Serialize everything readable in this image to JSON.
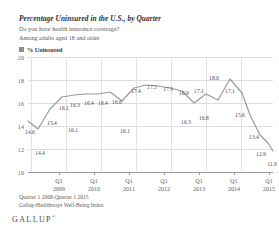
{
  "header": {
    "title": "Percentage Uninsured in the U.S., by Quarter",
    "subtitle_1": "Do you have health insurance coverage?",
    "subtitle_2": "Among adults aged 18 and older"
  },
  "legend": {
    "label": "% Uninsured",
    "swatch_color": "#8c8c8c",
    "icon": "legend-square-icon"
  },
  "footer": {
    "line_1": "Quarter 1 2008-Quarter 1 2015",
    "line_2": "Gallup-Healthways Well-Being Index",
    "brand": "GALLUP",
    "brand_mark": "®"
  },
  "colors": {
    "line": "#9a9a9a",
    "grid": "#dcdcdc",
    "axis": "#9a9a9a",
    "text": "#3a3a3a"
  },
  "chart_data": {
    "type": "line",
    "title": "Percentage Uninsured in the U.S., by Quarter",
    "subtitle": "Do you have health insurance coverage? Among adults aged 18 and older",
    "xlabel": "",
    "ylabel": "",
    "ylim": [
      10,
      20
    ],
    "yticks": [
      10,
      12,
      14,
      16,
      18,
      20
    ],
    "ytick_labels": [
      "10",
      "12",
      "14",
      "16",
      "18",
      "20"
    ],
    "grid": true,
    "legend_position": "top-left",
    "series": [
      {
        "name": "% Uninsured",
        "color": "#9a9a9a",
        "x": [
          "Q1 2008",
          "Q2 2008",
          "Q3 2008",
          "Q4 2008",
          "Q1 2009",
          "Q2 2009",
          "Q3 2009",
          "Q4 2009",
          "Q1 2010",
          "Q2 2010",
          "Q3 2010",
          "Q4 2010",
          "Q1 2011",
          "Q2 2011",
          "Q3 2011",
          "Q4 2011",
          "Q1 2012",
          "Q2 2012",
          "Q3 2012",
          "Q4 2012",
          "Q1 2013",
          "Q2 2013",
          "Q3 2013",
          "Q4 2013",
          "Q1 2014",
          "Q2 2014",
          "Q3 2014",
          "Q4 2014",
          "Q1 2015"
        ],
        "values": [
          14.6,
          14.4,
          15.4,
          16.1,
          16.3,
          16.4,
          16.4,
          16.6,
          16.1,
          16.4,
          16.4,
          16.6,
          16.1,
          17.4,
          17.5,
          17.3,
          16.9,
          16.3,
          17.1,
          16.8,
          18.0,
          17.1,
          15.6,
          13.4,
          12.9,
          11.9,
          11.9,
          11.9,
          11.9
        ]
      }
    ],
    "point_labels": [
      {
        "text": "14.6",
        "x": 2,
        "y": 72,
        "pos": "above"
      },
      {
        "text": "14.4",
        "x": 12,
        "y": 93,
        "pos": "below"
      },
      {
        "text": "15.4",
        "x": 24,
        "y": 63,
        "pos": "above"
      },
      {
        "text": "16.1",
        "x": 45,
        "y": 70,
        "pos": "below"
      },
      {
        "text": "16.1",
        "x": 36,
        "y": 48,
        "pos": "above"
      },
      {
        "text": "16.3",
        "x": 47,
        "y": 45,
        "pos": "above"
      },
      {
        "text": "16.4",
        "x": 61,
        "y": 43,
        "pos": "above"
      },
      {
        "text": "16.4",
        "x": 75,
        "y": 43,
        "pos": "above"
      },
      {
        "text": "16.6",
        "x": 89,
        "y": 42,
        "pos": "above"
      },
      {
        "text": "16.1",
        "x": 97,
        "y": 71,
        "pos": "below"
      },
      {
        "text": "17.4",
        "x": 108,
        "y": 31,
        "pos": "above"
      },
      {
        "text": "17.5",
        "x": 124,
        "y": 27,
        "pos": "above"
      },
      {
        "text": "17.3",
        "x": 140,
        "y": 29,
        "pos": "above"
      },
      {
        "text": "16.9",
        "x": 156,
        "y": 33,
        "pos": "above"
      },
      {
        "text": "16.3",
        "x": 158,
        "y": 62,
        "pos": "below"
      },
      {
        "text": "17.1",
        "x": 171,
        "y": 31,
        "pos": "above"
      },
      {
        "text": "16.8",
        "x": 176,
        "y": 58,
        "pos": "below"
      },
      {
        "text": "18.0",
        "x": 186,
        "y": 18,
        "pos": "above"
      },
      {
        "text": "17.1",
        "x": 202,
        "y": 31,
        "pos": "above"
      },
      {
        "text": "15.6",
        "x": 212,
        "y": 55,
        "pos": "below"
      },
      {
        "text": "13.4",
        "x": 226,
        "y": 77,
        "pos": "below"
      },
      {
        "text": "12.9",
        "x": 233,
        "y": 94,
        "pos": "below"
      },
      {
        "text": "11.9",
        "x": 244,
        "y": 104,
        "pos": "below"
      }
    ],
    "xaxis_ticks": [
      {
        "quarter": "Q1",
        "year": "2009",
        "x": 31
      },
      {
        "quarter": "Q1",
        "year": "2010",
        "x": 66
      },
      {
        "quarter": "Q1",
        "year": "2011",
        "x": 101
      },
      {
        "quarter": "Q1",
        "year": "2012",
        "x": 136
      },
      {
        "quarter": "Q1",
        "year": "2013",
        "x": 171
      },
      {
        "quarter": "Q1",
        "year": "2014",
        "x": 206
      },
      {
        "quarter": "Q1",
        "year": "2015",
        "x": 241
      }
    ],
    "path": "M 0,64 L 10,72 L 22,52 L 34,40 L 46,38 L 58,37 L 70,37 L 82,35 L 94,44 L 106,31 L 118,28 L 130,29 L 142,31 L 154,34 L 166,46 L 178,37 L 190,43 L 202,22 L 214,36 L 222,58 L 232,78 L 240,86 L 245,94"
  }
}
